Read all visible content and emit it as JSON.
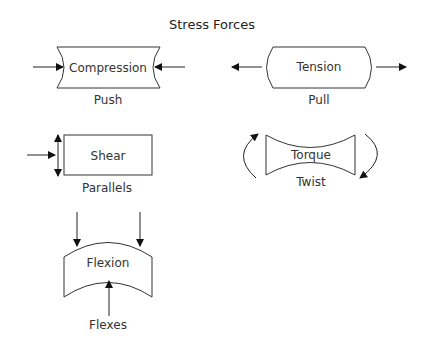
{
  "title": "Stress Forces",
  "colors": {
    "stroke": "#333333",
    "text": "#333333",
    "background": "#ffffff"
  },
  "forces": [
    {
      "name": "Compression",
      "caption": "Push"
    },
    {
      "name": "Tension",
      "caption": "Pull"
    },
    {
      "name": "Shear",
      "caption": "Parallels"
    },
    {
      "name": "Torque",
      "caption": "Twist"
    },
    {
      "name": "Flexion",
      "caption": "Flexes"
    }
  ]
}
